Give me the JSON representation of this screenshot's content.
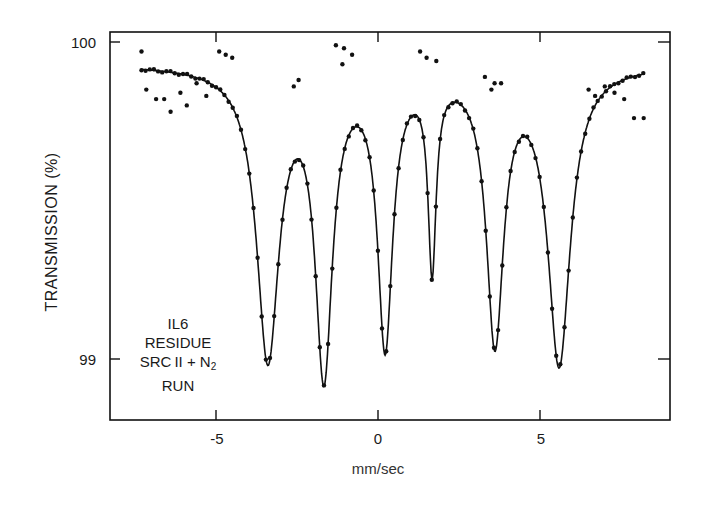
{
  "chart_data": {
    "type": "scatter",
    "title": "",
    "xlabel": "mm/sec",
    "ylabel": "TRANSMISSION (%)",
    "xlim": [
      -8.2,
      9.0
    ],
    "ylim": [
      98.8,
      100.03
    ],
    "x_ticks": [
      -5,
      0,
      5
    ],
    "x_tick_labels": [
      "-5",
      "0",
      "5"
    ],
    "y_ticks": [
      99,
      100
    ],
    "y_tick_labels": [
      "99",
      "100"
    ],
    "grid": false,
    "legend": null,
    "annotation": [
      "IL6",
      "RESIDUE",
      "SRC II + N2",
      "RUN"
    ],
    "series": [
      {
        "name": "fit",
        "kind": "line",
        "baseline": 99.93,
        "peaks": [
          {
            "position": -3.4,
            "min_transmission": 99.02,
            "hwhm": 0.42
          },
          {
            "position": -1.67,
            "min_transmission": 98.99,
            "hwhm": 0.32
          },
          {
            "position": 0.22,
            "min_transmission": 99.07,
            "hwhm": 0.28
          },
          {
            "position": 1.67,
            "min_transmission": 99.33,
            "hwhm": 0.15
          },
          {
            "position": 3.61,
            "min_transmission": 99.08,
            "hwhm": 0.32
          },
          {
            "position": 5.59,
            "min_transmission": 99.0,
            "hwhm": 0.42
          }
        ]
      },
      {
        "name": "data",
        "kind": "points",
        "note": "measured points lying on fit curve, plus scattered outliers below",
        "outliers": [
          [
            -7.3,
            99.97
          ],
          [
            -7.15,
            99.85
          ],
          [
            -6.85,
            99.82
          ],
          [
            -6.6,
            99.82
          ],
          [
            -6.4,
            99.78
          ],
          [
            -6.1,
            99.84
          ],
          [
            -5.9,
            99.8
          ],
          [
            -5.6,
            99.87
          ],
          [
            -5.3,
            99.83
          ],
          [
            -4.9,
            99.97
          ],
          [
            -4.7,
            99.96
          ],
          [
            -4.5,
            99.95
          ],
          [
            -2.6,
            99.86
          ],
          [
            -2.45,
            99.88
          ],
          [
            -1.3,
            99.99
          ],
          [
            -1.05,
            99.98
          ],
          [
            -0.8,
            99.96
          ],
          [
            -1.1,
            99.93
          ],
          [
            1.3,
            99.97
          ],
          [
            1.5,
            99.95
          ],
          [
            1.8,
            99.94
          ],
          [
            3.3,
            99.89
          ],
          [
            3.6,
            99.87
          ],
          [
            3.8,
            99.87
          ],
          [
            3.5,
            99.85
          ],
          [
            6.5,
            99.85
          ],
          [
            6.7,
            99.83
          ],
          [
            7.0,
            99.86
          ],
          [
            7.3,
            99.84
          ],
          [
            7.6,
            99.82
          ],
          [
            7.9,
            99.76
          ],
          [
            8.2,
            99.76
          ]
        ]
      }
    ]
  },
  "colors": {
    "ink": "#111111",
    "background": "#ffffff"
  }
}
